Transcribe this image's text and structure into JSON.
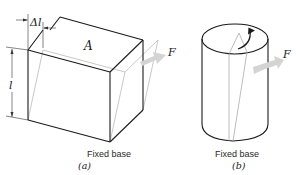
{
  "figure": {
    "panel_a": {
      "caption": "(a)",
      "base_label": "Fixed base",
      "top_face_label": "A",
      "height_label": "l",
      "displacement_label": "Δl",
      "force_label": "F"
    },
    "panel_b": {
      "caption": "(b)",
      "base_label": "Fixed base",
      "force_label": "F"
    },
    "colors": {
      "outline": "#1a1a1a",
      "dashed": "#9a9a9a",
      "arrow_fill": "#d4d4d4"
    }
  }
}
